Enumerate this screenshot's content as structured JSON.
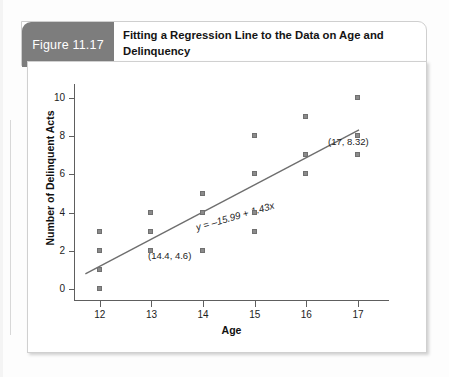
{
  "figure": {
    "tab_label": "Figure 11.17",
    "title": "Fitting a Regression Line to the Data on Age and Delinquency"
  },
  "chart_data": {
    "type": "scatter",
    "title": "Fitting a Regression Line to the Data on Age and Delinquency",
    "xlabel": "Age",
    "ylabel": "Number of Delinquent Acts",
    "xlim": [
      11.5,
      17.6
    ],
    "ylim": [
      -0.6,
      10.6
    ],
    "xticks": [
      12,
      13,
      14,
      15,
      16,
      17
    ],
    "yticks": [
      0,
      2,
      4,
      6,
      8,
      10
    ],
    "grid": false,
    "legend": "none",
    "marker": "square",
    "marker_color": "#8a8a8a",
    "line_color": "#6e6e6e",
    "points": [
      {
        "x": 12,
        "y": 0
      },
      {
        "x": 12,
        "y": 1
      },
      {
        "x": 12,
        "y": 2
      },
      {
        "x": 12,
        "y": 3
      },
      {
        "x": 13,
        "y": 2
      },
      {
        "x": 13,
        "y": 3
      },
      {
        "x": 13,
        "y": 4
      },
      {
        "x": 14,
        "y": 2
      },
      {
        "x": 14,
        "y": 4
      },
      {
        "x": 14,
        "y": 5
      },
      {
        "x": 15,
        "y": 3
      },
      {
        "x": 15,
        "y": 4
      },
      {
        "x": 15,
        "y": 6
      },
      {
        "x": 15,
        "y": 8
      },
      {
        "x": 16,
        "y": 6
      },
      {
        "x": 16,
        "y": 7
      },
      {
        "x": 16,
        "y": 9
      },
      {
        "x": 17,
        "y": 7
      },
      {
        "x": 17,
        "y": 8
      },
      {
        "x": 17,
        "y": 10
      }
    ],
    "regression": {
      "equation": "y = –15.99 + 1.43x",
      "intercept": -15.99,
      "slope": 1.43,
      "x_start": 11.72,
      "x_end": 17.02
    },
    "annotations": [
      {
        "text": "(14.4, 4.6)",
        "x": 14.4,
        "y": 4.6
      },
      {
        "text": "(17, 8.32)",
        "x": 17,
        "y": 8.32
      }
    ]
  }
}
